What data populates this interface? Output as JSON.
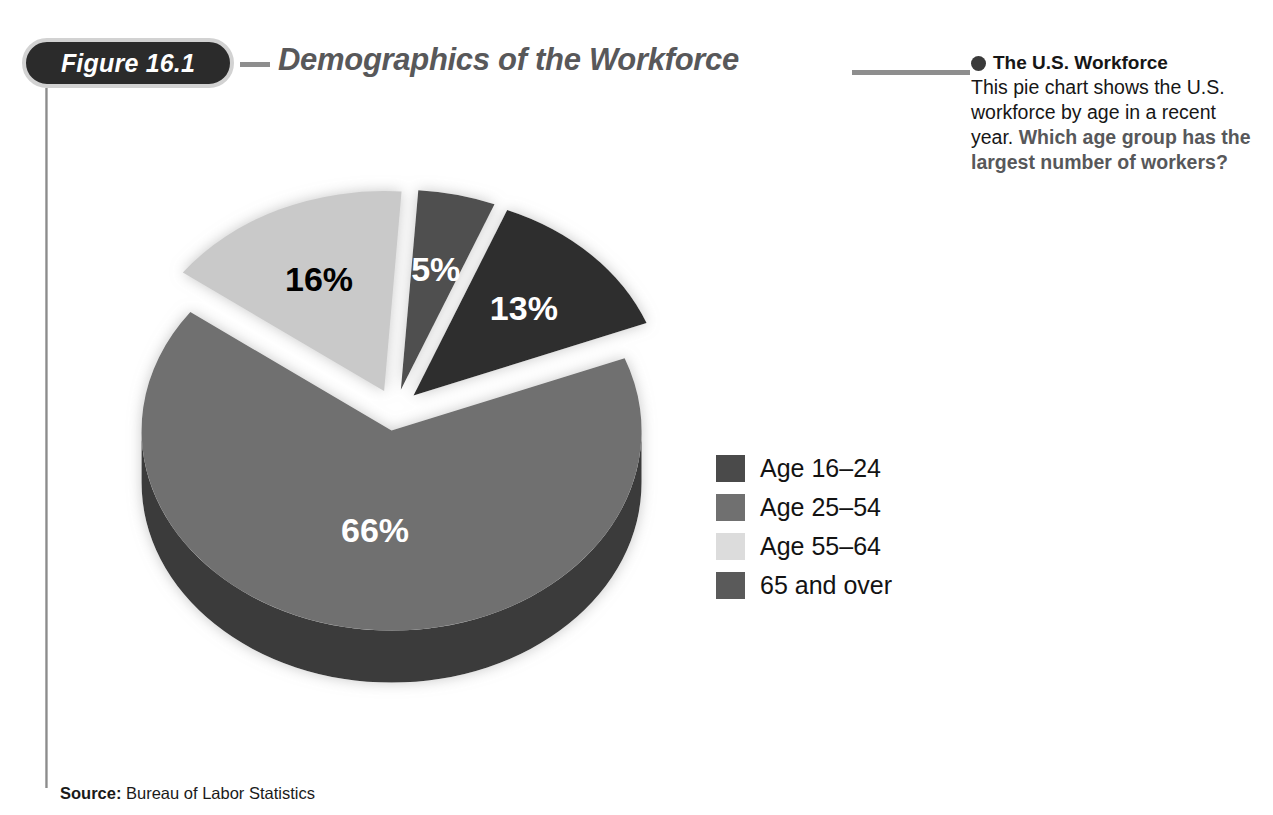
{
  "figure": {
    "badge_label": "Figure 16.1",
    "title": "Demographics of the Workforce"
  },
  "caption": {
    "bullet_icon": "filled-circle-icon",
    "heading": "The U.S. Workforce",
    "body_text": "This pie chart shows the U.S. workforce by age in a recent year. ",
    "question_text": "Which age group has the largest number of workers?"
  },
  "source": {
    "label": "Source:",
    "text": " Bureau of Labor Statistics"
  },
  "legend": {
    "items": [
      {
        "label": "Age 16–24",
        "color": "#4a4a4a"
      },
      {
        "label": "Age 25–54",
        "color": "#707070"
      },
      {
        "label": "Age 55–64",
        "color": "#dcdcdc"
      },
      {
        "label": "65 and over",
        "color": "#5a5a5a"
      }
    ]
  },
  "chart_data": {
    "type": "pie",
    "title": "Demographics of the Workforce",
    "subtitle": "The U.S. Workforce",
    "categories": [
      "Age 16–24",
      "Age 25–54",
      "Age 55–64",
      "65 and over"
    ],
    "values": [
      13,
      66,
      16,
      5
    ],
    "value_labels": [
      "13%",
      "66%",
      "16%",
      "5%"
    ],
    "colors": [
      "#2f2f2f",
      "#707070",
      "#c9c9c9",
      "#4f4f4f"
    ],
    "side_colors": [
      "#171717",
      "#3a3a3a",
      "#6e6e6e",
      "#2c2c2c"
    ],
    "label_text_colors": [
      "#ffffff",
      "#ffffff",
      "#000000",
      "#ffffff"
    ],
    "units": "percent",
    "exploded": true,
    "three_d": true,
    "legend_position": "right",
    "grid": false,
    "source": "Bureau of Labor Statistics"
  }
}
